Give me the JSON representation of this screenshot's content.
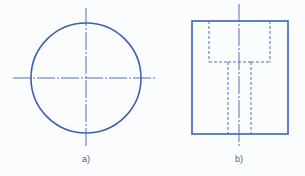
{
  "colors": {
    "stroke": "#3b63ad",
    "background": "#fbfcfd",
    "label": "#3d5f9a"
  },
  "figures": [
    {
      "id": "a",
      "label": "a)",
      "description": "Top view: circle with centerlines",
      "circle": {
        "cx": 86,
        "cy": 78,
        "r": 55
      },
      "centerlines": {
        "horizontal": {
          "x1": 13,
          "x2": 157,
          "y": 78
        },
        "vertical": {
          "x": 86,
          "y1": 8,
          "y2": 146
        }
      }
    },
    {
      "id": "b",
      "label": "b)",
      "description": "Front view: rectangle with hidden counterbore and through-hole",
      "outline": {
        "x": 192,
        "y": 21,
        "width": 96,
        "height": 113
      },
      "centerline": {
        "x": 239,
        "y1": 4,
        "y2": 146
      },
      "hidden_counterbore": {
        "x1": 209,
        "x2": 270,
        "y_top": 21,
        "y_bottom": 62
      },
      "hidden_through_hole": {
        "x1": 228,
        "x2": 251,
        "y_top": 62,
        "y_bottom": 134
      }
    }
  ]
}
